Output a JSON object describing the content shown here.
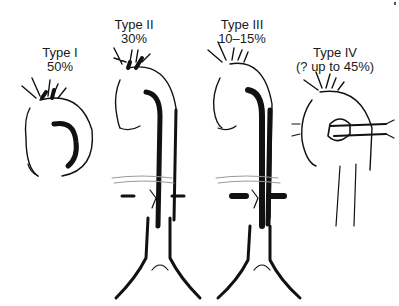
{
  "diagram": {
    "panels": [
      {
        "id": "type-1",
        "title": "Type I",
        "frequency": "50%"
      },
      {
        "id": "type-2",
        "title": "Type II",
        "frequency": "30%"
      },
      {
        "id": "type-3",
        "title": "Type III",
        "frequency": "10–15%"
      },
      {
        "id": "type-4",
        "title": "Type IV",
        "frequency": "(? up to 45%)"
      }
    ],
    "colors": {
      "ink": "#111111",
      "background": "#ffffff"
    }
  }
}
